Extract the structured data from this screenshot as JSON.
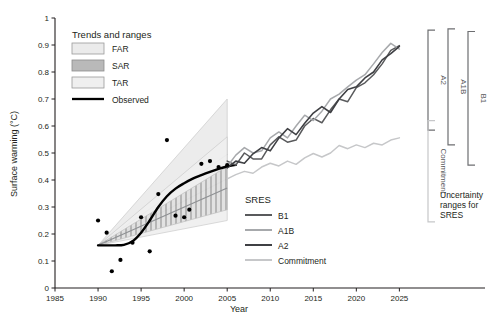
{
  "chart_data": {
    "type": "line",
    "title": "",
    "xlabel": "Year",
    "ylabel": "Surface warming (°C)",
    "xlim": [
      1985,
      2026
    ],
    "ylim": [
      0,
      1
    ],
    "xticks": [
      1985,
      1990,
      1995,
      2000,
      2005,
      2010,
      2015,
      2020,
      2025
    ],
    "yticks": [
      "0",
      "0.1",
      "0.2",
      "0.3",
      "0.4",
      "0.5",
      "0.6",
      "0.7",
      "0.8",
      "0.9",
      "1"
    ],
    "grid": false,
    "legend_position": "top-left",
    "series": [
      {
        "name": "Observed",
        "color": "#000000",
        "width": 2.4,
        "points": [
          [
            1990,
            0.158
          ],
          [
            1991,
            0.158
          ],
          [
            1992,
            0.158
          ],
          [
            1993,
            0.16
          ],
          [
            1994,
            0.173
          ],
          [
            1995,
            0.205
          ],
          [
            1996,
            0.25
          ],
          [
            1997,
            0.3
          ],
          [
            1998,
            0.34
          ],
          [
            1999,
            0.368
          ],
          [
            2000,
            0.388
          ],
          [
            2001,
            0.405
          ],
          [
            2002,
            0.418
          ],
          [
            2003,
            0.43
          ],
          [
            2004,
            0.441
          ],
          [
            2005,
            0.45
          ],
          [
            2006,
            0.456
          ]
        ]
      },
      {
        "name": "B1",
        "color": "#595a5c",
        "width": 1.5,
        "points": [
          [
            2005,
            0.47
          ],
          [
            2006,
            0.455
          ],
          [
            2007,
            0.5
          ],
          [
            2008,
            0.478
          ],
          [
            2009,
            0.478
          ],
          [
            2010,
            0.53
          ],
          [
            2011,
            0.56
          ],
          [
            2012,
            0.54
          ],
          [
            2013,
            0.548
          ],
          [
            2014,
            0.6
          ],
          [
            2015,
            0.628
          ],
          [
            2016,
            0.612
          ],
          [
            2017,
            0.66
          ],
          [
            2018,
            0.7
          ],
          [
            2019,
            0.69
          ],
          [
            2020,
            0.742
          ],
          [
            2021,
            0.76
          ],
          [
            2022,
            0.79
          ],
          [
            2023,
            0.83
          ],
          [
            2024,
            0.88
          ],
          [
            2025,
            0.898
          ]
        ]
      },
      {
        "name": "A1B",
        "color": "#a7a9ac",
        "width": 1.5,
        "points": [
          [
            2005,
            0.45
          ],
          [
            2006,
            0.492
          ],
          [
            2007,
            0.52
          ],
          [
            2008,
            0.5
          ],
          [
            2009,
            0.508
          ],
          [
            2010,
            0.556
          ],
          [
            2011,
            0.578
          ],
          [
            2012,
            0.556
          ],
          [
            2013,
            0.6
          ],
          [
            2014,
            0.64
          ],
          [
            2015,
            0.62
          ],
          [
            2016,
            0.655
          ],
          [
            2017,
            0.7
          ],
          [
            2018,
            0.718
          ],
          [
            2019,
            0.745
          ],
          [
            2020,
            0.77
          ],
          [
            2021,
            0.79
          ],
          [
            2022,
            0.83
          ],
          [
            2023,
            0.872
          ],
          [
            2024,
            0.906
          ],
          [
            2025,
            0.885
          ]
        ]
      },
      {
        "name": "A2",
        "color": "#3f4044",
        "width": 1.6,
        "points": [
          [
            2005,
            0.445
          ],
          [
            2006,
            0.47
          ],
          [
            2007,
            0.462
          ],
          [
            2008,
            0.497
          ],
          [
            2009,
            0.52
          ],
          [
            2010,
            0.508
          ],
          [
            2011,
            0.555
          ],
          [
            2012,
            0.59
          ],
          [
            2013,
            0.568
          ],
          [
            2014,
            0.61
          ],
          [
            2015,
            0.648
          ],
          [
            2016,
            0.672
          ],
          [
            2017,
            0.65
          ],
          [
            2018,
            0.7
          ],
          [
            2019,
            0.735
          ],
          [
            2020,
            0.745
          ],
          [
            2021,
            0.778
          ],
          [
            2022,
            0.8
          ],
          [
            2023,
            0.845
          ],
          [
            2024,
            0.868
          ],
          [
            2025,
            0.895
          ]
        ]
      },
      {
        "name": "Commitment",
        "color": "#c6c7c9",
        "width": 1.5,
        "points": [
          [
            2005,
            0.404
          ],
          [
            2006,
            0.42
          ],
          [
            2007,
            0.432
          ],
          [
            2008,
            0.425
          ],
          [
            2009,
            0.448
          ],
          [
            2010,
            0.462
          ],
          [
            2011,
            0.452
          ],
          [
            2012,
            0.47
          ],
          [
            2013,
            0.458
          ],
          [
            2014,
            0.482
          ],
          [
            2015,
            0.498
          ],
          [
            2016,
            0.485
          ],
          [
            2017,
            0.5
          ],
          [
            2018,
            0.528
          ],
          [
            2019,
            0.516
          ],
          [
            2020,
            0.53
          ],
          [
            2021,
            0.52
          ],
          [
            2022,
            0.536
          ],
          [
            2023,
            0.53
          ],
          [
            2024,
            0.548
          ],
          [
            2025,
            0.556
          ]
        ]
      }
    ],
    "scatter": {
      "name": "Annual observations",
      "color": "#000000",
      "marker": "circle",
      "points": [
        [
          1990,
          0.25
        ],
        [
          1991,
          0.205
        ],
        [
          1991.6,
          0.062
        ],
        [
          1992.6,
          0.104
        ],
        [
          1994,
          0.168
        ],
        [
          1995,
          0.262
        ],
        [
          1996,
          0.136
        ],
        [
          1997,
          0.348
        ],
        [
          1998,
          0.548
        ],
        [
          1999,
          0.268
        ],
        [
          2000,
          0.262
        ],
        [
          2000.6,
          0.29
        ],
        [
          2002,
          0.46
        ],
        [
          2003,
          0.47
        ],
        [
          2004,
          0.448
        ],
        [
          2005,
          0.455
        ]
      ]
    },
    "wedges": [
      {
        "name": "FAR",
        "x0": 1990,
        "y0": 0.158,
        "x1": 2005,
        "y_low": 0.29,
        "y_high": 0.7,
        "fill": "#ebebeb",
        "stroke": "#c9c9c9",
        "hatch": false
      },
      {
        "name": "TAR",
        "x0": 1990,
        "y0": 0.158,
        "x1": 2005,
        "y_low": 0.25,
        "y_high": 0.56,
        "fill": "#f0f0f0",
        "stroke": "#c9c9c9",
        "hatch": false
      },
      {
        "name": "SAR",
        "x0": 1990,
        "y0": 0.158,
        "x1": 2005,
        "y_low": 0.29,
        "y_high": 0.45,
        "fill": "#d6d6d6",
        "stroke": "#bdbdbd",
        "hatch": true
      }
    ],
    "annotations": [
      {
        "text": "A2",
        "type": "uncertainty-bracket",
        "y_high": 0.955,
        "y_low": 0.585
      },
      {
        "text": "A1B",
        "type": "uncertainty-bracket",
        "y_high": 0.96,
        "y_low": 0.53
      },
      {
        "text": "B1",
        "type": "uncertainty-bracket",
        "y_high": 0.95,
        "y_low": 0.455
      },
      {
        "text": "Commitment",
        "type": "uncertainty-bracket",
        "y_high": 0.62,
        "y_low": 0.245
      }
    ]
  },
  "legend_trends": {
    "title": "Trends and ranges",
    "items": [
      {
        "label": "FAR",
        "swatch": "#ebebeb",
        "border": "#9a9a9a",
        "type": "box"
      },
      {
        "label": "SAR",
        "swatch": "#b9b9b9",
        "border": "#8c8c8c",
        "type": "box"
      },
      {
        "label": "TAR",
        "swatch": "#efefef",
        "border": "#9a9a9a",
        "type": "box"
      },
      {
        "label": "Observed",
        "swatch": "#000000",
        "border": "#000000",
        "type": "line"
      }
    ]
  },
  "legend_sres": {
    "title": "SRES",
    "items": [
      {
        "label": "B1",
        "swatch": "#595a5c",
        "type": "line"
      },
      {
        "label": "A1B",
        "swatch": "#a7a9ac",
        "type": "line"
      },
      {
        "label": "A2",
        "swatch": "#3f4044",
        "type": "line"
      },
      {
        "label": "Commitment",
        "swatch": "#c6c7c9",
        "type": "line"
      }
    ]
  },
  "brackets": {
    "labels": [
      "A2",
      "A1B",
      "B1",
      "Commitment"
    ],
    "caption_lines": [
      "Uncertainty",
      "ranges for",
      "SRES"
    ]
  }
}
